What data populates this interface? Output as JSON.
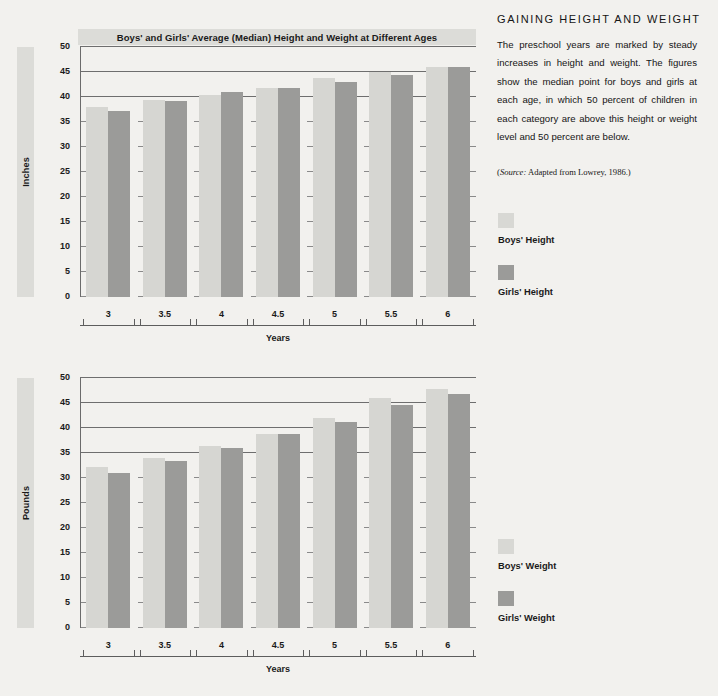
{
  "figure": {
    "title": "Boys' and Girls' Average (Median) Height and Weight at Different Ages"
  },
  "sidebar": {
    "heading": "GAINING HEIGHT AND WEIGHT",
    "body": "The preschool years are marked by steady increases in height and weight. The figures show the median point for boys and girls at each age, in which 50 percent of children in each category are above this height or weight level and 50 percent are below.",
    "source_prefix": "Source:",
    "source_text": " Adapted from Lowrey, 1986.)",
    "source_open": "(",
    "legend_height": [
      {
        "label": "Boys' Height",
        "color": "#d8d8d4"
      },
      {
        "label": "Girls' Height",
        "color": "#9b9b99"
      }
    ],
    "legend_weight": [
      {
        "label": "Boys' Weight",
        "color": "#d8d8d4"
      },
      {
        "label": "Girls' Weight",
        "color": "#9b9b99"
      }
    ]
  },
  "chart_data": [
    {
      "type": "bar",
      "id": "height",
      "title": "Boys' and Girls' Average (Median) Height and Weight at Different Ages",
      "xlabel": "Years",
      "ylabel": "Inches",
      "categories": [
        "3",
        "3.5",
        "4",
        "4.5",
        "5",
        "5.5",
        "6"
      ],
      "ytick_labels": [
        "50",
        "45",
        "40",
        "35",
        "30",
        "25",
        "20",
        "15",
        "10",
        "5",
        "0"
      ],
      "ylim": [
        0,
        50
      ],
      "ytick_step": 5,
      "gridlines": [
        50,
        45,
        40
      ],
      "grid": true,
      "legend_position": "right",
      "series": [
        {
          "name": "Boys' Height",
          "color": "#d6d6d2",
          "values": [
            38.0,
            39.5,
            40.5,
            41.8,
            43.8,
            45.0,
            46.0
          ]
        },
        {
          "name": "Girls' Height",
          "color": "#9b9b99",
          "values": [
            37.2,
            39.2,
            41.0,
            41.8,
            43.0,
            44.5,
            46.0
          ]
        }
      ]
    },
    {
      "type": "bar",
      "id": "weight",
      "title": "",
      "xlabel": "Years",
      "ylabel": "Pounds",
      "categories": [
        "3",
        "3.5",
        "4",
        "4.5",
        "5",
        "5.5",
        "6"
      ],
      "ytick_labels": [
        "50",
        "45",
        "40",
        "35",
        "30",
        "25",
        "20",
        "15",
        "10",
        "5",
        "0"
      ],
      "ylim": [
        0,
        50
      ],
      "ytick_step": 5,
      "gridlines": [
        50,
        45,
        40,
        35
      ],
      "grid": true,
      "legend_position": "right",
      "series": [
        {
          "name": "Boys' Weight",
          "color": "#d6d6d2",
          "values": [
            32.2,
            34.1,
            36.4,
            38.8,
            42.0,
            46.0,
            47.9
          ]
        },
        {
          "name": "Girls' Weight",
          "color": "#9b9b99",
          "values": [
            31.1,
            33.5,
            36.0,
            38.8,
            41.3,
            44.6,
            46.9
          ]
        }
      ]
    }
  ]
}
